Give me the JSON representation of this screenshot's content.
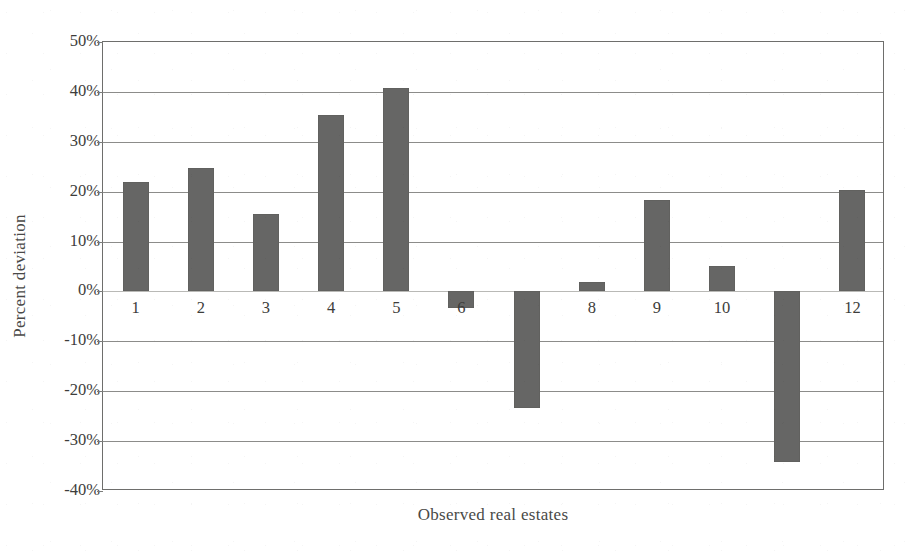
{
  "chart_data": {
    "type": "bar",
    "title": "",
    "xlabel": "Observed real estates",
    "ylabel": "Percent deviation",
    "categories": [
      "1",
      "2",
      "3",
      "4",
      "5",
      "6",
      "7",
      "8",
      "9",
      "10",
      "11",
      "12"
    ],
    "visible_tick_labels": [
      "1",
      "2",
      "3",
      "4",
      "5",
      "6",
      "",
      "8",
      "9",
      "10",
      "",
      "12"
    ],
    "values": [
      22,
      24.8,
      15.5,
      35.3,
      40.8,
      -3.3,
      -23.4,
      1.8,
      18.4,
      5.1,
      -34.2,
      20.4
    ],
    "value_labels": [
      "22%",
      "24.8%",
      "15.5%",
      "35.3%",
      "40.8%",
      "-3.3%",
      "-23.4%",
      "1.8%",
      "18.4%",
      "5.1%",
      "-34.2%",
      "20.4%"
    ],
    "ylim": [
      -40,
      50
    ],
    "yticks": [
      50,
      40,
      30,
      20,
      10,
      0,
      -10,
      -20,
      -30,
      -40
    ],
    "ytick_labels": [
      "50%",
      "40%",
      "30%",
      "20%",
      "10%",
      "0%",
      "-10%",
      "-20%",
      "-30%",
      "-40%"
    ],
    "grid": true,
    "legend": "none",
    "bar_color": "#666665",
    "gridline_color": "#8c8c8a",
    "axis_color": "#6e6e6c",
    "background": "#ffffff"
  }
}
